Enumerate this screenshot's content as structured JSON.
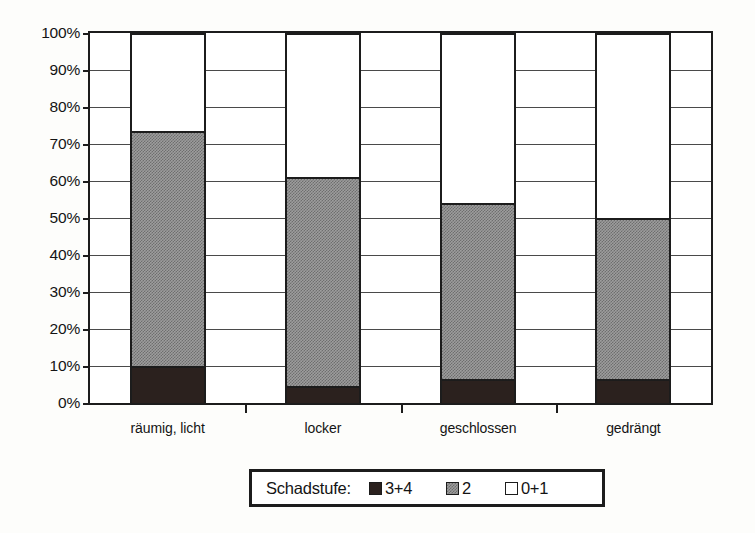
{
  "chart_data": {
    "type": "bar",
    "subtype": "stacked-100-percent",
    "title": "",
    "xlabel": "",
    "ylabel": "",
    "ylim": [
      0,
      100
    ],
    "yticks": [
      "0%",
      "10%",
      "20%",
      "30%",
      "40%",
      "50%",
      "60%",
      "70%",
      "80%",
      "90%",
      "100%"
    ],
    "ytick_values": [
      0,
      10,
      20,
      30,
      40,
      50,
      60,
      70,
      80,
      90,
      100
    ],
    "grid": true,
    "legend_position": "bottom-center",
    "legend_title": "Schadstufe:",
    "categories": [
      "räumig, licht",
      "locker",
      "geschlossen",
      "gedrängt"
    ],
    "series": [
      {
        "name": "3+4",
        "color": "#2b211e",
        "pattern": "solid-black",
        "values": [
          10.0,
          4.5,
          6.5,
          6.5
        ]
      },
      {
        "name": "2",
        "color": "#9d9d9d",
        "pattern": "gray-stipple",
        "values": [
          63.5,
          56.5,
          47.5,
          43.5
        ]
      },
      {
        "name": "0+1",
        "color": "#ffffff",
        "pattern": "white-outline",
        "values": [
          26.5,
          39.0,
          46.0,
          50.0
        ]
      }
    ],
    "cumulative_tops": [
      {
        "category": "räumig, licht",
        "black_top": 10.0,
        "gray_top": 73.5,
        "white_top": 100
      },
      {
        "category": "locker",
        "black_top": 4.5,
        "gray_top": 61.0,
        "white_top": 100
      },
      {
        "category": "geschlossen",
        "black_top": 6.5,
        "gray_top": 54.0,
        "white_top": 100
      },
      {
        "category": "gedrängt",
        "black_top": 6.5,
        "gray_top": 50.0,
        "white_top": 100
      }
    ]
  },
  "axis": {
    "y_labels": [
      "100%",
      "90%",
      "80%",
      "70%",
      "60%",
      "50%",
      "40%",
      "30%",
      "20%",
      "10%",
      "0%"
    ]
  },
  "legend": {
    "title": "Schadstufe:",
    "entries": [
      {
        "label": "3+4",
        "swatch": "black-swatch"
      },
      {
        "label": "2",
        "swatch": "gray-swatch"
      },
      {
        "label": "0+1",
        "swatch": "white-swatch"
      }
    ]
  },
  "colors": {
    "black": "#2b211e",
    "gray": "#9d9d9d",
    "white": "#ffffff",
    "axis": "#1c1c1c",
    "grid": "#4a4a4a",
    "background": "#fdfdfb"
  }
}
